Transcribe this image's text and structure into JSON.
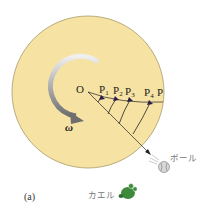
{
  "figure": {
    "caption_label": "(a)",
    "disk": {
      "fill": "#f6e3a3",
      "stroke": "#a89a6a"
    },
    "center_label": "O",
    "omega_label": "ω",
    "points": [
      {
        "main": "P",
        "sub": "1"
      },
      {
        "main": "P",
        "sub": "2"
      },
      {
        "main": "P",
        "sub": "3"
      },
      {
        "main": "P",
        "sub": "4"
      },
      {
        "main": "P",
        "sub": ""
      }
    ],
    "ball_label": "ボール",
    "frog_label": "カエル",
    "colors": {
      "arrow": "#2a1f4a",
      "rotation_arrow": "#8a8a8a",
      "frog": "#3c8a3a",
      "ball": "#d8d8d8"
    },
    "icons": [
      "rotation-arrow-icon",
      "ball-icon",
      "frog-icon"
    ]
  }
}
